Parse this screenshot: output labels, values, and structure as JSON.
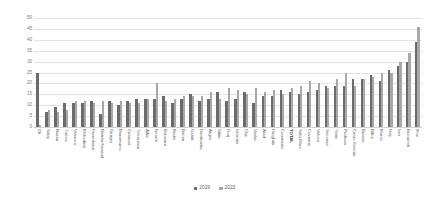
{
  "chart_data": {
    "type": "bar",
    "title": "",
    "subtitle": "",
    "xlabel": "",
    "ylabel": "",
    "ylim": [
      0,
      50
    ],
    "yticks": [
      0,
      5,
      10,
      15,
      20,
      25,
      30,
      35,
      40,
      45,
      50
    ],
    "grid": true,
    "legend_position": "bottom",
    "categories": [
      "Olt",
      "Salaj",
      "Buzau",
      "Tulcea",
      "Vrancea",
      "Mehedinti",
      "Hunedoara",
      "Bistrita-Nasaud",
      "Giurgiu",
      "Maramures",
      "Calarasi",
      "Teleorman",
      "Alba",
      "Neamt",
      "Botosani",
      "Braila",
      "Bacau",
      "Galati",
      "Dambovita",
      "Arges",
      "Sibiu",
      "Gorj",
      "Ialomita",
      "Cluj",
      "Vaslui",
      "Arad",
      "Harghita",
      "Constanta",
      "TOTAL",
      "Satu Mare",
      "Covasna",
      "Valcea",
      "Suceava",
      "Timis",
      "Prahova",
      "Caras-Severin",
      "Brasov",
      "Bihor",
      "Mures",
      "Dolj",
      "Iasi",
      "Bucuresti",
      "Ilfov"
    ],
    "series": [
      {
        "name": "2019",
        "color": "#6b6b6b",
        "values": [
          25,
          7,
          9,
          11,
          11,
          11,
          12,
          6,
          12,
          10,
          12,
          13,
          13,
          13,
          14,
          11,
          13,
          15,
          12,
          13,
          16,
          12,
          13,
          16,
          11,
          14,
          14,
          17,
          16,
          15,
          16,
          17,
          19,
          19,
          19,
          22,
          22,
          24,
          21,
          26,
          28,
          30,
          39
        ]
      },
      {
        "name": "2023",
        "color": "#a8a8a8",
        "values": [
          1,
          8,
          7,
          8,
          12,
          12,
          11,
          12,
          11,
          12,
          11,
          11,
          13,
          20,
          12,
          13,
          14,
          14,
          14,
          16,
          13,
          18,
          17,
          15,
          18,
          16,
          17,
          15,
          18,
          19,
          21,
          20,
          18,
          22,
          25,
          19,
          22,
          23,
          25,
          25,
          30,
          34,
          46
        ]
      }
    ],
    "legend": [
      {
        "label": "2019",
        "color": "#6b6b6b"
      },
      {
        "label": "2023",
        "color": "#a8a8a8"
      }
    ]
  }
}
